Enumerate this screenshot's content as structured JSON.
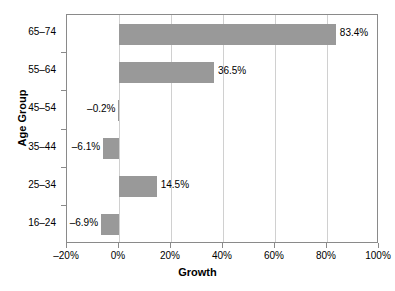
{
  "chart_data": {
    "type": "bar",
    "orientation": "horizontal",
    "title": "",
    "xlabel": "Growth",
    "ylabel": "Age Group",
    "categories": [
      "16–24",
      "25–34",
      "35–44",
      "45–54",
      "55–64",
      "65–74"
    ],
    "values": [
      -6.9,
      14.5,
      -6.1,
      -0.2,
      36.5,
      83.4
    ],
    "data_labels": [
      "–6.9%",
      "14.5%",
      "–6.1%",
      "–0.2%",
      "36.5%",
      "83.4%"
    ],
    "xlim": [
      -20,
      100
    ],
    "xticks": [
      -20,
      0,
      20,
      40,
      60,
      80,
      100
    ],
    "xtick_labels": [
      "–20%",
      "0%",
      "20%",
      "40%",
      "60%",
      "80%",
      "100%"
    ],
    "grid": true,
    "legend": false,
    "bar_color": "#999999",
    "gridline_color": "#d0d0d0",
    "axis_color": "#8a8a8a",
    "text_color": "#000000",
    "background": "#ffffff"
  }
}
